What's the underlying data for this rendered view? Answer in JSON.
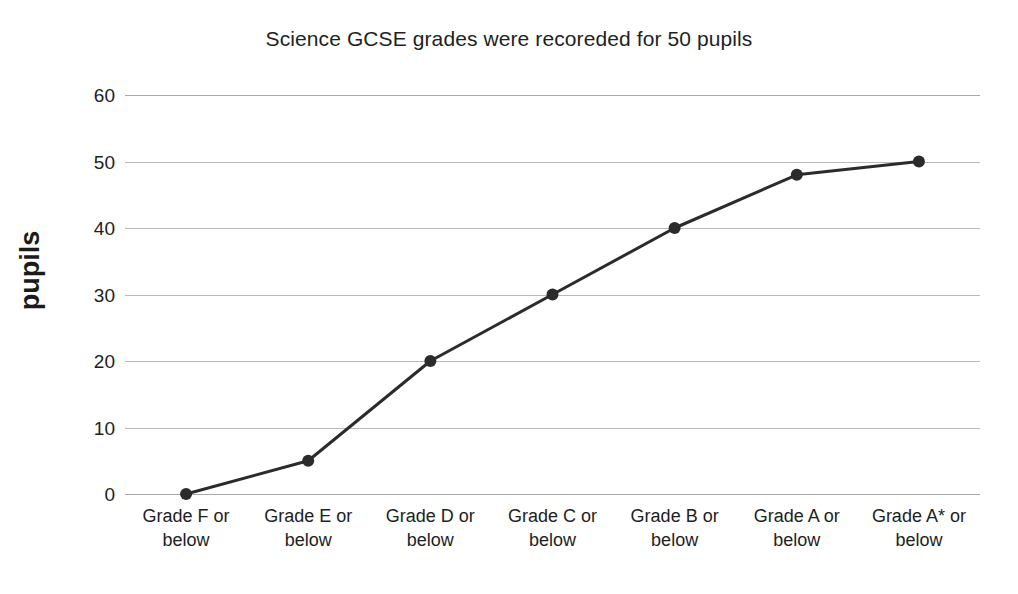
{
  "chart_data": {
    "type": "line",
    "title": "Science GCSE grades were recoreded for 50 pupils",
    "xlabel": "",
    "ylabel": "pupils",
    "categories": [
      "Grade F or below",
      "Grade E or below",
      "Grade D or below",
      "Grade C or below",
      "Grade B or below",
      "Grade A or below",
      "Grade A* or below"
    ],
    "category_lines": [
      [
        "Grade F or",
        "below"
      ],
      [
        "Grade E or",
        "below"
      ],
      [
        "Grade D or",
        "below"
      ],
      [
        "Grade C or",
        "below"
      ],
      [
        "Grade B or",
        "below"
      ],
      [
        "Grade A or",
        "below"
      ],
      [
        "Grade A* or",
        "below"
      ]
    ],
    "values": [
      0,
      5,
      20,
      30,
      40,
      48,
      50
    ],
    "ylim": [
      0,
      60
    ],
    "y_ticks": [
      0,
      10,
      20,
      30,
      40,
      50,
      60
    ],
    "y_tick_labels": [
      "0",
      "10",
      "20",
      "30",
      "40",
      "50",
      "60"
    ],
    "grid": true,
    "grid_axis": "y",
    "legend": "none",
    "series_color": "#2b2b2b",
    "grid_color": "#b9b9b9",
    "marker": "circle",
    "marker_size": 6,
    "line_width": 3
  }
}
